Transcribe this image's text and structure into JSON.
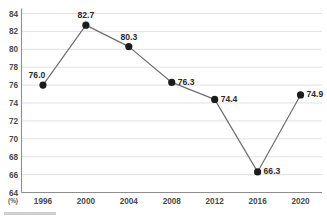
{
  "chart_data": {
    "type": "line",
    "title": "",
    "subtitle": "",
    "xlabel": "",
    "ylabel": "",
    "unit_label": "(%)",
    "categories": [
      "1996",
      "2000",
      "2004",
      "2008",
      "2012",
      "2016",
      "2020"
    ],
    "values": [
      76.0,
      82.7,
      80.3,
      76.3,
      74.4,
      66.3,
      74.9
    ],
    "point_labels": [
      "76.0",
      "82.7",
      "80.3",
      "76.3",
      "74.4",
      "66.3",
      "74.9"
    ],
    "label_positions": [
      "left-above",
      "above",
      "above",
      "right",
      "right",
      "right",
      "right"
    ],
    "ylim": [
      64,
      84
    ],
    "yticks": [
      64,
      66,
      68,
      70,
      72,
      74,
      76,
      78,
      80,
      82,
      84
    ],
    "ytick_labels": [
      "64",
      "66",
      "68",
      "70",
      "72",
      "74",
      "76",
      "78",
      "80",
      "82",
      "84"
    ],
    "xtick_labels": [
      "1996",
      "2000",
      "2004",
      "2008",
      "2012",
      "2016",
      "2020"
    ],
    "grid": "horizontal",
    "legend": "none",
    "series": [
      {
        "name": "",
        "values": [
          76.0,
          82.7,
          80.3,
          76.3,
          74.4,
          66.3,
          74.9
        ]
      }
    ],
    "colors": {
      "line": "#6f6f6f",
      "marker": "#1c1c1c",
      "gridline": "#d9d9d9",
      "axis": "#8e8e8e",
      "tick_text": "#4a4a4a",
      "label_text": "#2b2b2b",
      "background": "#ffffff"
    }
  }
}
